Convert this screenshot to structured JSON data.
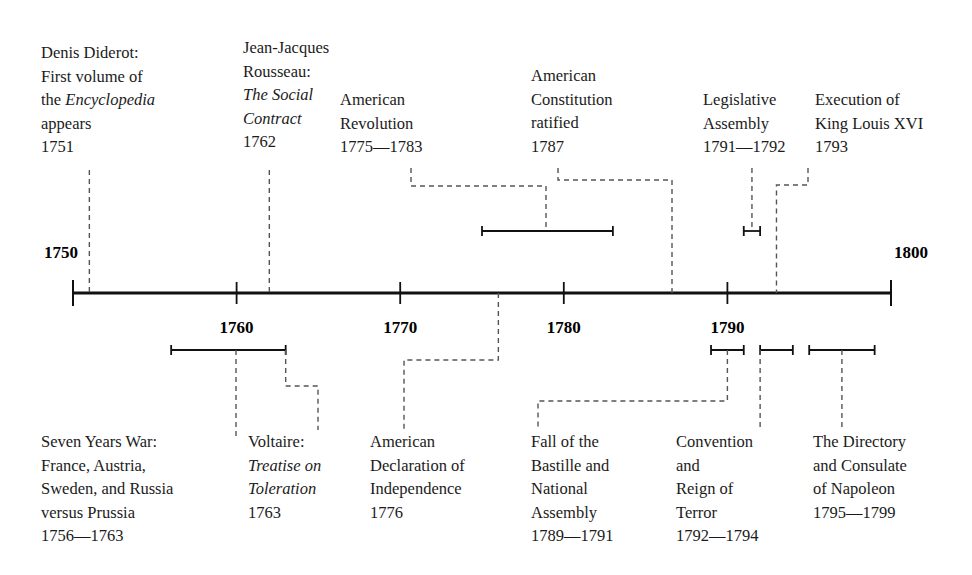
{
  "figure": {
    "type": "timeline",
    "axis": {
      "start_year": 1750,
      "end_year": 1800,
      "tick_years": [
        1750,
        1760,
        1770,
        1780,
        1790,
        1800
      ],
      "tick_labels": [
        "1750",
        "1760",
        "1770",
        "1780",
        "1790",
        "1800"
      ],
      "label_1750": "1750",
      "label_1760": "1760",
      "label_1770": "1770",
      "label_1780": "1780",
      "label_1790": "1790",
      "label_1800": "1800",
      "line_color": "#111111",
      "connector_color": "#555555"
    },
    "events_above": [
      {
        "id": "diderot",
        "lines": [
          "Denis Diderot:",
          "First volume of",
          "the |Encyclopedia|",
          "appears",
          "1751"
        ],
        "date_text": "1751",
        "start_year": 1751,
        "end_year": 1751,
        "span": false
      },
      {
        "id": "rousseau",
        "lines": [
          "Jean-Jacques",
          "Rousseau:",
          "|The Social|",
          "|Contract|",
          "1762"
        ],
        "date_text": "1762",
        "start_year": 1762,
        "end_year": 1762,
        "span": false
      },
      {
        "id": "american-revolution",
        "lines": [
          "American",
          "Revolution",
          "1775—1783"
        ],
        "date_text": "1775—1783",
        "start_year": 1775,
        "end_year": 1783,
        "span": true
      },
      {
        "id": "constitution-ratified",
        "lines": [
          "American",
          "Constitution",
          "ratified",
          "1787"
        ],
        "date_text": "1787",
        "start_year": 1787,
        "end_year": 1787,
        "span": false
      },
      {
        "id": "legislative-assembly",
        "lines": [
          "Legislative",
          "Assembly",
          "1791—1792"
        ],
        "date_text": "1791—1792",
        "start_year": 1791,
        "end_year": 1792,
        "span": true
      },
      {
        "id": "execution-louis-xvi",
        "lines": [
          "Execution of",
          "King Louis XVI",
          "1793"
        ],
        "date_text": "1793",
        "start_year": 1793,
        "end_year": 1793,
        "span": false
      }
    ],
    "events_below": [
      {
        "id": "seven-years-war",
        "lines": [
          "Seven Years War:",
          "France, Austria,",
          "Sweden, and Russia",
          "versus Prussia",
          "1756—1763"
        ],
        "date_text": "1756—1763",
        "start_year": 1756,
        "end_year": 1763,
        "span": true
      },
      {
        "id": "voltaire-toleration",
        "lines": [
          "Voltaire:",
          "|Treatise on|",
          "|Toleration|",
          "1763"
        ],
        "date_text": "1763",
        "start_year": 1763,
        "end_year": 1763,
        "span": false
      },
      {
        "id": "declaration-independence",
        "lines": [
          "American",
          "Declaration of",
          "Independence",
          "1776"
        ],
        "date_text": "1776",
        "start_year": 1776,
        "end_year": 1776,
        "span": false
      },
      {
        "id": "fall-of-bastille",
        "lines": [
          "Fall of the",
          "Bastille and",
          "National",
          "Assembly",
          "1789—1791"
        ],
        "date_text": "1789—1791",
        "start_year": 1789,
        "end_year": 1791,
        "span": true
      },
      {
        "id": "convention-reign-of-terror",
        "lines": [
          "Convention",
          "and",
          "Reign of",
          "Terror",
          "1792—1794"
        ],
        "date_text": "1792—1794",
        "start_year": 1792,
        "end_year": 1794,
        "span": true
      },
      {
        "id": "directory-consulate",
        "lines": [
          "The Directory",
          "and Consulate",
          "of Napoleon",
          "1795—1799"
        ],
        "date_text": "1795—1799",
        "start_year": 1795,
        "end_year": 1799,
        "span": true
      }
    ]
  }
}
